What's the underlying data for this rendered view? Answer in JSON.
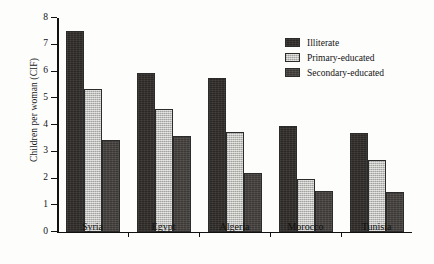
{
  "chart_data": {
    "type": "bar",
    "title": "",
    "xlabel": "",
    "ylabel": "Children per woman (CIF)",
    "ylim": [
      0,
      8
    ],
    "yticks": [
      0,
      1,
      2,
      3,
      4,
      5,
      6,
      7,
      8
    ],
    "grid": false,
    "legend_position": "upper right",
    "categories": [
      "Syria",
      "Egypt",
      "Algeria",
      "Morocco",
      "Tunisia"
    ],
    "series": [
      {
        "name": "Illiterate",
        "color": "#2a2724",
        "values": [
          7.5,
          5.95,
          5.75,
          3.95,
          3.7
        ]
      },
      {
        "name": "Primary-educated",
        "color": "#b9b9b5",
        "values": [
          5.35,
          4.6,
          3.75,
          2.0,
          2.7
        ]
      },
      {
        "name": "Secondary-educated",
        "color": "#3b3835",
        "values": [
          3.45,
          3.6,
          2.2,
          1.55,
          1.5
        ]
      }
    ]
  }
}
